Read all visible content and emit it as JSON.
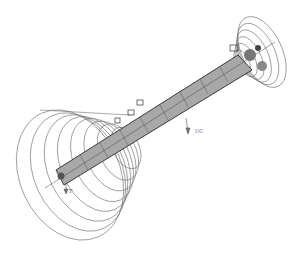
{
  "figure": {
    "type": "3D wireframe engineering model",
    "labels": [
      {
        "id": "label-uc",
        "text": "UC",
        "x": 196,
        "y": 131
      },
      {
        "id": "label-t",
        "text": "T",
        "x": 68,
        "y": 192
      }
    ]
  },
  "colors": {
    "background": "#ffffff",
    "ring": "#6a6a6a",
    "shaft_fill": "#9a9a9a",
    "shaft_dark": "#3a3a3a"
  }
}
